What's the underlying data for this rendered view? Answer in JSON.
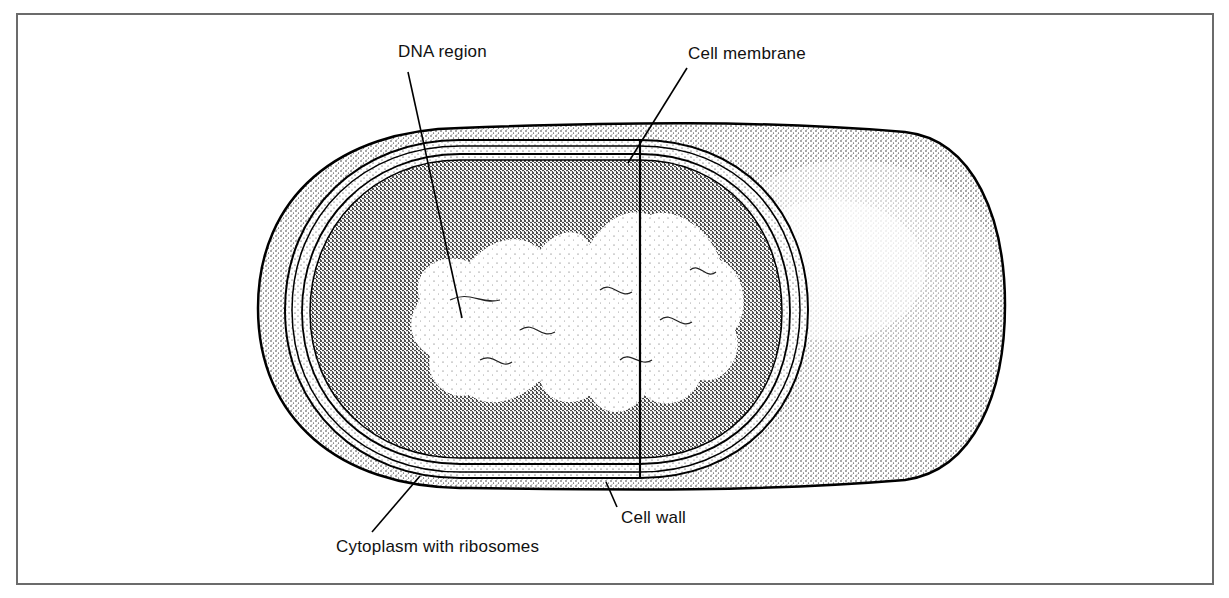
{
  "figure": {
    "colors": {
      "ink": "#111111",
      "frame": "#6b6b6b",
      "background": "#ffffff"
    }
  },
  "labels": [
    {
      "id": "dna",
      "text": "DNA region",
      "x": 398,
      "y": 42,
      "line": [
        408,
        72,
        462,
        318
      ]
    },
    {
      "id": "membrane",
      "text": "Cell membrane",
      "x": 688,
      "y": 44,
      "line": [
        687,
        68,
        628,
        163
      ]
    },
    {
      "id": "cytoplasm",
      "text": "Cytoplasm with ribosomes",
      "x": 336,
      "y": 537,
      "line": [
        372,
        532,
        420,
        476
      ]
    },
    {
      "id": "wall",
      "text": "Cell wall",
      "x": 621,
      "y": 508,
      "line": [
        617,
        507,
        606,
        482
      ]
    }
  ]
}
